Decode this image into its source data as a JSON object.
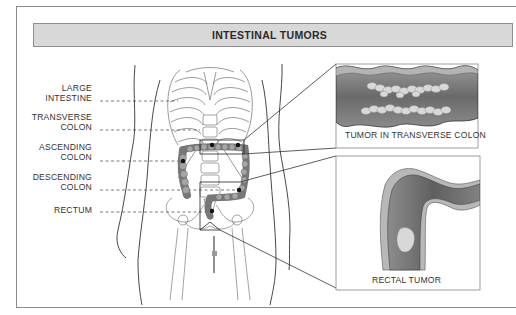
{
  "header": {
    "title": "INTESTINAL TUMORS"
  },
  "labels": [
    {
      "id": "large-intestine",
      "line1": "LARGE",
      "line2": "INTESTINE"
    },
    {
      "id": "transverse-colon",
      "line1": "TRANSVERSE",
      "line2": "COLON"
    },
    {
      "id": "ascending-colon",
      "line1": "ASCENDING",
      "line2": "COLON"
    },
    {
      "id": "descending-colon",
      "line1": "DESCENDING",
      "line2": "COLON"
    },
    {
      "id": "rectum",
      "line1": "",
      "line2": "RECTUM"
    }
  ],
  "insets": {
    "transverse": {
      "caption": "TUMOR IN TRANSVERSE COLON"
    },
    "rectal": {
      "caption": "RECTAL TUMOR"
    }
  },
  "colors": {
    "header_bg": "#d8d8d8",
    "frame": "#8a8a8a",
    "colon_wall": "#7a7a7a",
    "colon_lumen": "#6e6e6e",
    "tumor": "#d9d9d9"
  }
}
